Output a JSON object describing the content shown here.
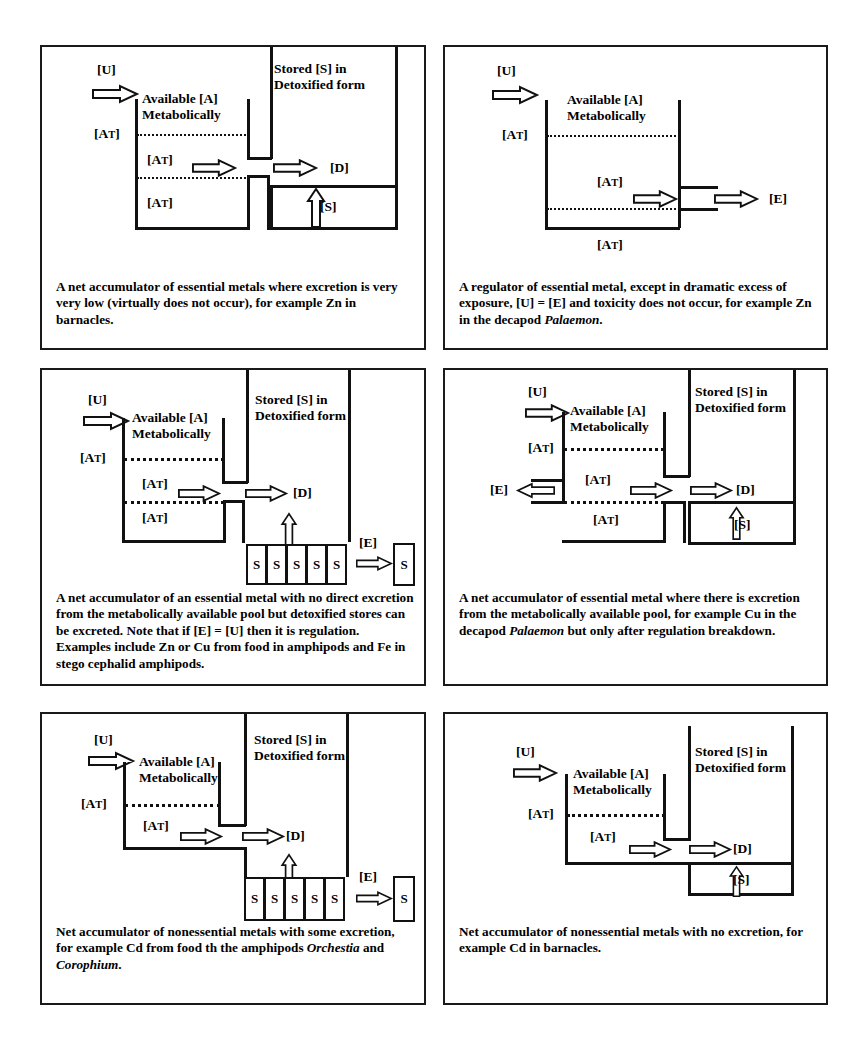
{
  "figure": {
    "line_color": "#111111",
    "background": "#ffffff"
  },
  "common_labels": {
    "uptake": "[U]",
    "available_pool_line1": "Available [A]",
    "available_pool_line2": "Metabolically",
    "stored_line1": "Stored [S] in",
    "stored_line2": "Detoxified form",
    "threshold": "[AT]",
    "detox": "[D]",
    "excretion": "[E]",
    "stored": "[S]",
    "store_unit": "S"
  },
  "panels": [
    {
      "id": "panel-1",
      "position": "top-left",
      "type": "net-accumulator-essential-no-excretion",
      "labels": {
        "uptake": "[U]",
        "pool_title_1": "Available [A]",
        "pool_title_2": "Metabolically",
        "stored_title_1": "Stored [S] in",
        "stored_title_2": "Detoxified form",
        "at_upper": "[AT]",
        "at_middle": "[AT]",
        "at_lower": "[AT]",
        "detox": "[D]",
        "stored": "[S]"
      },
      "features": {
        "uptake_arrow": true,
        "detox_arrow_from_pool": true,
        "detox_arrow_to_D": true,
        "store_up_arrow": true,
        "excretion_arrow": false,
        "store_blocks": 0,
        "solid_store": true,
        "dotted_lines": 2
      },
      "caption": "A net accumulator of essential metals where excretion is very very low (virtually does not occur), for example Zn in barnacles."
    },
    {
      "id": "panel-2",
      "position": "top-right",
      "type": "regulator-essential",
      "labels": {
        "uptake": "[U]",
        "pool_title_1": "Available [A]",
        "pool_title_2": "Metabolically",
        "at_upper": "[AT]",
        "at_middle": "[AT]",
        "at_lower": "[AT]",
        "excretion": "[E]"
      },
      "features": {
        "uptake_arrow": true,
        "excretion_arrow": true,
        "store_column": false,
        "store_blocks": 0,
        "dotted_lines": 2
      },
      "caption_parts": [
        {
          "text": "A regulator of essential metal, except in dramatic excess of exposure, [U] = [E] and toxicity does not occur, for example Zn in the decapod ",
          "italic": false
        },
        {
          "text": "Palaemon",
          "italic": true
        },
        {
          "text": ".",
          "italic": false
        }
      ],
      "caption": "A regulator of essential metal, except in dramatic excess of exposure, [U] = [E] and toxicity does not occur, for example Zn in the decapod Palaemon."
    },
    {
      "id": "panel-3",
      "position": "middle-left",
      "type": "net-accumulator-essential-detox-excreted",
      "labels": {
        "uptake": "[U]",
        "pool_title_1": "Available [A]",
        "pool_title_2": "Metabolically",
        "stored_title_1": "Stored [S] in",
        "stored_title_2": "Detoxified form",
        "at_upper": "[AT]",
        "at_middle": "[AT]",
        "at_lower": "[AT]",
        "detox": "[D]",
        "excretion": "[E]",
        "store_unit": "S"
      },
      "features": {
        "uptake_arrow": true,
        "detox_arrow_from_pool": true,
        "detox_arrow_to_D": true,
        "store_up_arrow": true,
        "excretion_arrow": true,
        "store_blocks": 5,
        "external_store_block": true,
        "dotted_lines": 2
      },
      "caption": "A net accumulator of an essential metal with no direct excretion from the metabolically available pool but detoxified stores can be excreted. Note that if [E] = [U] then it is regulation. Examples include Zn or Cu from food in amphipods and Fe in stego cephalid amphipods."
    },
    {
      "id": "panel-4",
      "position": "middle-right",
      "type": "net-accumulator-essential-with-pool-excretion",
      "labels": {
        "uptake": "[U]",
        "pool_title_1": "Available [A]",
        "pool_title_2": "Metabolically",
        "stored_title_1": "Stored [S] in",
        "stored_title_2": "Detoxified form",
        "at_upper": "[AT]",
        "at_middle": "[AT]",
        "at_lower": "[AT]",
        "detox": "[D]",
        "excretion": "[E]",
        "stored": "[S]"
      },
      "features": {
        "uptake_arrow": true,
        "left_excretion_arrow": true,
        "detox_arrow_from_pool": true,
        "detox_arrow_to_D": true,
        "store_up_arrow": true,
        "store_blocks": 0,
        "solid_store": true,
        "dotted_lines": 2
      },
      "caption_parts": [
        {
          "text": "A net accumulator of essential metal where there is excretion from the metabolically available pool, for example Cu in the decapod ",
          "italic": false
        },
        {
          "text": "Palaemon",
          "italic": true
        },
        {
          "text": " but only after regulation breakdown.",
          "italic": false
        }
      ],
      "caption": "A net accumulator of essential metal where there is excretion from the metabolically available pool, for example Cu in the decapod Palaemon but only after regulation breakdown."
    },
    {
      "id": "panel-5",
      "position": "bottom-left",
      "type": "net-accumulator-nonessential-some-excretion",
      "labels": {
        "uptake": "[U]",
        "pool_title_1": "Available [A]",
        "pool_title_2": "Metabolically",
        "stored_title_1": "Stored [S] in",
        "stored_title_2": "Detoxified form",
        "at_upper": "[AT]",
        "at_middle": "[AT]",
        "detox": "[D]",
        "excretion": "[E]",
        "store_unit": "S"
      },
      "features": {
        "uptake_arrow": true,
        "detox_arrow_from_pool": true,
        "detox_arrow_to_D": true,
        "store_up_arrow": true,
        "excretion_arrow": true,
        "store_blocks": 5,
        "external_store_block": true,
        "dotted_lines": 1
      },
      "caption_parts": [
        {
          "text": "Net accumulator of nonessential metals with some excretion, for example Cd from food th the amphipods ",
          "italic": false
        },
        {
          "text": "Orchestia",
          "italic": true
        },
        {
          "text": " and ",
          "italic": false
        },
        {
          "text": "Corophium",
          "italic": true
        },
        {
          "text": ".",
          "italic": false
        }
      ],
      "caption": "Net accumulator of nonessential metals with some excretion, for example Cd from food th the amphipods Orchestia and Corophium."
    },
    {
      "id": "panel-6",
      "position": "bottom-right",
      "type": "net-accumulator-nonessential-no-excretion",
      "labels": {
        "uptake": "[U]",
        "pool_title_1": "Available [A]",
        "pool_title_2": "Metabolically",
        "stored_title_1": "Stored [S] in",
        "stored_title_2": "Detoxified form",
        "at_upper": "[AT]",
        "at_middle": "[AT]",
        "detox": "[D]",
        "stored": "[S]"
      },
      "features": {
        "uptake_arrow": true,
        "detox_arrow_from_pool": true,
        "detox_arrow_to_D": true,
        "store_up_arrow": true,
        "excretion_arrow": false,
        "store_blocks": 0,
        "solid_store": true,
        "dotted_lines": 1
      },
      "caption": "Net accumulator of nonessential metals with no excretion, for example Cd in barnacles."
    }
  ]
}
